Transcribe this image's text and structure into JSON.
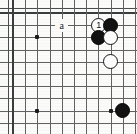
{
  "diagram": {
    "kind": "go-board-corner-diagram",
    "width": 137,
    "height": 134,
    "board": {
      "origin_x": 13,
      "origin_y": 13,
      "spacing": 12.2,
      "cols": 11,
      "rows": 10,
      "edge_top": true,
      "edge_left": true,
      "edge_right": false,
      "edge_bottom": false,
      "grid_color": "#5f6163",
      "edge_color": "#3a3c3e",
      "background_color": "#fbfbfa"
    },
    "star_points": [
      {
        "col": 2,
        "row": 2
      },
      {
        "col": 2,
        "row": 8
      },
      {
        "col": 8,
        "row": 8
      }
    ],
    "stones": [
      {
        "col": 7,
        "row": 1,
        "color": "white",
        "label": "1",
        "name": "stone-move-1"
      },
      {
        "col": 8,
        "row": 1,
        "color": "black",
        "label": "",
        "name": "stone-black-a"
      },
      {
        "col": 7,
        "row": 2,
        "color": "black",
        "label": "",
        "name": "stone-black-b"
      },
      {
        "col": 8,
        "row": 2,
        "color": "white",
        "label": "",
        "name": "stone-white-a"
      },
      {
        "col": 8,
        "row": 4,
        "color": "white",
        "label": "",
        "name": "stone-white-b"
      },
      {
        "col": 9,
        "row": 8,
        "color": "black",
        "label": "",
        "name": "stone-black-c"
      }
    ],
    "point_labels": [
      {
        "col": 4,
        "row": 1,
        "text": "a",
        "name": "point-label-a"
      }
    ]
  }
}
